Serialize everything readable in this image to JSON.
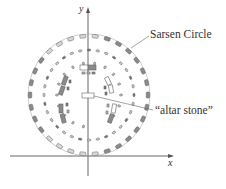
{
  "diagram": {
    "axes": {
      "x_label": "x",
      "y_label": "y"
    },
    "labels": {
      "sarsen_circle": "Sarsen Circle",
      "altar_stone": "“altar stone”"
    },
    "colors": {
      "line": "#555555",
      "stone_dark": "#8a8a8a",
      "stone_light": "#c8c8c8",
      "text": "#333333"
    }
  }
}
